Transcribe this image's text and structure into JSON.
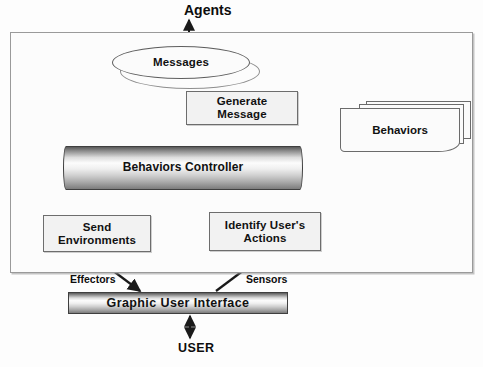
{
  "diagram": {
    "container": {
      "name": "agent-boundary"
    },
    "nodes": {
      "messages": {
        "label": "Messages",
        "shape": "ellipse"
      },
      "generate_message": {
        "label": "Generate\nMessage",
        "line1": "Generate",
        "line2": "Message",
        "shape": "rectangle"
      },
      "behaviors": {
        "label": "Behaviors",
        "shape": "card-stack",
        "card_count": 3
      },
      "behaviors_controller": {
        "label": "Behaviors Controller",
        "shape": "cylinder-bar"
      },
      "send_environments": {
        "label": "Send\nEnvironments",
        "line1": "Send",
        "line2": "Environments",
        "shape": "rectangle"
      },
      "identify_user_actions": {
        "label": "Identify User's\nActions",
        "line1": "Identify User's",
        "line2": "Actions",
        "shape": "rectangle"
      },
      "graphic_user_interface": {
        "label": "Graphic User Interface",
        "shape": "cylinder-bar"
      }
    },
    "labels": {
      "agents": "Agents",
      "user": "USER",
      "effectors": "Effectors",
      "sensors": "Sensors"
    },
    "edges": [
      {
        "from": "agents",
        "to": "messages",
        "style": "double-arrow",
        "direction": "bidirectional"
      },
      {
        "from": "messages",
        "to": "behaviors_controller",
        "style": "arrow",
        "direction": "down"
      },
      {
        "from": "generate_message",
        "to": "messages",
        "style": "arrow",
        "direction": "up-left"
      },
      {
        "from": "behaviors_controller",
        "to": "generate_message",
        "style": "arrow",
        "direction": "up"
      },
      {
        "from": "behaviors",
        "to": "behaviors_controller",
        "style": "arrow",
        "direction": "down-left"
      },
      {
        "from": "behaviors_controller",
        "to": "send_environments",
        "style": "arrow",
        "direction": "down"
      },
      {
        "from": "identify_user_actions",
        "to": "behaviors_controller",
        "style": "arrow",
        "direction": "up"
      },
      {
        "from": "send_environments",
        "to": "graphic_user_interface",
        "style": "arrow",
        "direction": "down-right",
        "label": "Effectors"
      },
      {
        "from": "graphic_user_interface",
        "to": "identify_user_actions",
        "style": "arrow",
        "direction": "up-right",
        "label": "Sensors"
      },
      {
        "from": "user",
        "to": "graphic_user_interface",
        "style": "double-arrow",
        "direction": "bidirectional"
      }
    ],
    "colors": {
      "stroke": "#1a1a1a",
      "node_fill": "#f2f2f2",
      "node_border": "#6d6d6d",
      "container_border": "#9a9a9a",
      "background": "#fdfdfd",
      "text": "#111111"
    }
  }
}
